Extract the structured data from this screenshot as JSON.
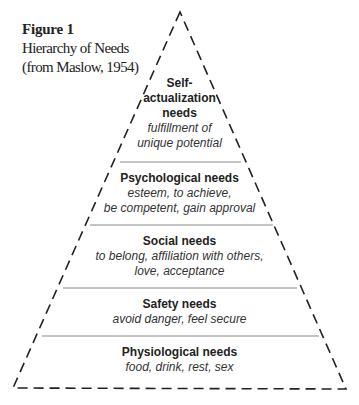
{
  "caption": {
    "figure_label": "Figure 1",
    "title": "Hierarchy of Needs",
    "source": "(from Maslow, 1954)"
  },
  "pyramid": {
    "tiers": [
      {
        "title_lines": [
          "Self-",
          "actualization",
          "needs"
        ],
        "desc_lines": [
          "fulfillment of",
          "unique potential"
        ]
      },
      {
        "title_lines": [
          "Psychological needs"
        ],
        "desc_lines": [
          "esteem, to achieve,",
          "be competent, gain approval"
        ]
      },
      {
        "title_lines": [
          "Social needs"
        ],
        "desc_lines": [
          "to belong, affiliation with others,",
          "love, acceptance"
        ]
      },
      {
        "title_lines": [
          "Safety needs"
        ],
        "desc_lines": [
          "avoid danger, feel secure"
        ]
      },
      {
        "title_lines": [
          "Physiological needs"
        ],
        "desc_lines": [
          "food, drink, rest, sex"
        ]
      }
    ]
  }
}
